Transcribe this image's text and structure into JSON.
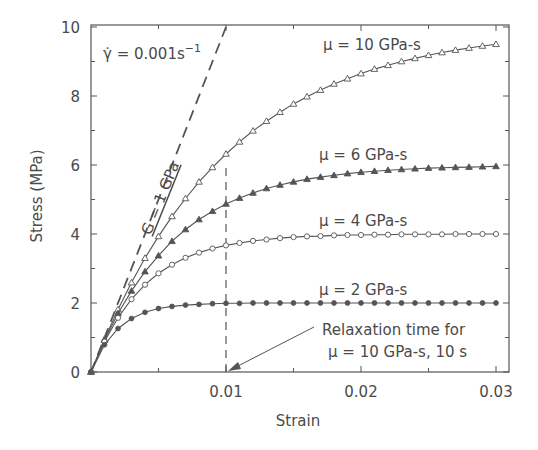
{
  "chart_data": {
    "type": "line",
    "title": "",
    "xlabel": "Strain",
    "ylabel": "Stress (MPa)",
    "xlim": [
      0,
      0.0313
    ],
    "ylim": [
      0,
      10
    ],
    "x_ticks": [
      0.01,
      0.02,
      0.03
    ],
    "x_tick_labels": [
      "0.01",
      "0.02",
      "0.03"
    ],
    "x_minor_ticks": [
      0.005,
      0.015,
      0.025
    ],
    "y_ticks": [
      0,
      2,
      4,
      6,
      8,
      10
    ],
    "y_tick_labels": [
      "0",
      "2",
      "4",
      "6",
      "8",
      "10"
    ],
    "y_minor_ticks": [
      1,
      3,
      5,
      7,
      9
    ],
    "grid": false,
    "legend": "none (inline labels)",
    "strain_rate": 0.001,
    "modulus_GPa": 1,
    "x": [
      0,
      0.001,
      0.002,
      0.003,
      0.004,
      0.005,
      0.006,
      0.007,
      0.008,
      0.009,
      0.01,
      0.011,
      0.012,
      0.013,
      0.014,
      0.015,
      0.016,
      0.017,
      0.018,
      0.019,
      0.02,
      0.021,
      0.022,
      0.023,
      0.024,
      0.025,
      0.026,
      0.027,
      0.028,
      0.029,
      0.03
    ],
    "series": [
      {
        "name": "μ = 10 GPa-s",
        "viscosity": 10,
        "marker": "open-triangle",
        "values": [
          0,
          0.95,
          1.81,
          2.59,
          3.3,
          3.93,
          4.51,
          5.03,
          5.51,
          5.93,
          6.32,
          6.67,
          6.99,
          7.27,
          7.53,
          7.77,
          7.98,
          8.17,
          8.35,
          8.5,
          8.65,
          8.78,
          8.89,
          9.0,
          9.09,
          9.18,
          9.26,
          9.33,
          9.39,
          9.45,
          9.5
        ]
      },
      {
        "name": "μ = 6 GPa-s",
        "viscosity": 6,
        "marker": "filled-triangle",
        "values": [
          0,
          0.92,
          1.7,
          2.35,
          2.91,
          3.37,
          3.79,
          4.13,
          4.42,
          4.66,
          4.87,
          5.04,
          5.19,
          5.32,
          5.42,
          5.51,
          5.59,
          5.65,
          5.7,
          5.75,
          5.79,
          5.82,
          5.85,
          5.87,
          5.89,
          5.91,
          5.92,
          5.93,
          5.94,
          5.95,
          5.96
        ]
      },
      {
        "name": "μ = 4 GPa-s",
        "viscosity": 4,
        "marker": "open-circle",
        "values": [
          0,
          0.88,
          1.57,
          2.11,
          2.53,
          2.86,
          3.11,
          3.31,
          3.46,
          3.58,
          3.67,
          3.74,
          3.8,
          3.84,
          3.88,
          3.91,
          3.93,
          3.94,
          3.96,
          3.97,
          3.97,
          3.98,
          3.98,
          3.99,
          3.99,
          3.99,
          3.99,
          4.0,
          4.0,
          4.0,
          4.0
        ]
      },
      {
        "name": "μ = 2 GPa-s",
        "viscosity": 2,
        "marker": "filled-circle",
        "values": [
          0,
          0.79,
          1.26,
          1.55,
          1.73,
          1.84,
          1.9,
          1.94,
          1.96,
          1.98,
          1.99,
          1.99,
          2.0,
          2.0,
          2.0,
          2.0,
          2.0,
          2.0,
          2.0,
          2.0,
          2.0,
          2.0,
          2.0,
          2.0,
          2.0,
          2.0,
          2.0,
          2.0,
          2.0,
          2.0,
          2.0
        ]
      }
    ],
    "reference_lines": [
      {
        "name": "G = 1 GPa",
        "style": "dashed",
        "points": [
          [
            0,
            0
          ],
          [
            0.01,
            10
          ]
        ]
      },
      {
        "name": "relaxation-time marker",
        "style": "dashed",
        "points": [
          [
            0.01,
            0
          ],
          [
            0.01,
            6.32
          ]
        ]
      }
    ],
    "annotations": [
      {
        "text_prefix": "γ̇ = 0.001s",
        "superscript": "−1"
      },
      {
        "text": "G = 1 GPa"
      },
      {
        "text": "μ = 10 GPa-s"
      },
      {
        "text": "μ = 6 GPa-s"
      },
      {
        "text": "μ = 4 GPa-s"
      },
      {
        "text": "μ = 2 GPa-s"
      },
      {
        "text": "Relaxation time for"
      },
      {
        "text": "μ = 10 GPa-s, 10 s"
      }
    ]
  },
  "labels": {
    "rate_prefix": "γ̇ = 0.001s",
    "rate_sup": "−1",
    "modulus": "G = 1 GPa",
    "mu10": "μ = 10 GPa-s",
    "mu6": "μ = 6 GPa-s",
    "mu4": "μ = 4 GPa-s",
    "mu2": "μ = 2 GPa-s",
    "relax_line1": "Relaxation time for",
    "relax_line2": "μ = 10 GPa-s, 10 s"
  },
  "colors": {
    "axis": "#555555",
    "line": "#555555",
    "text": "#4a4a4a",
    "background": "#ffffff"
  }
}
